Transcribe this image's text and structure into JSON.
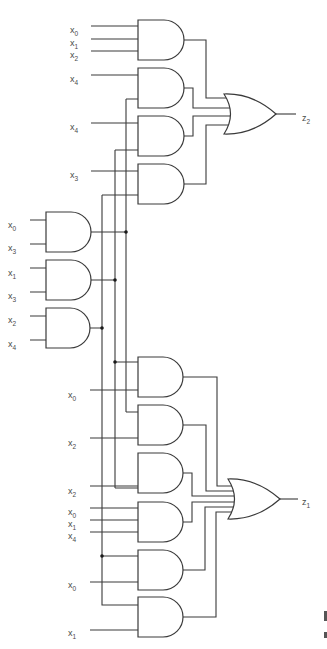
{
  "diagram": {
    "colors": {
      "line": "#3a3a3a",
      "text": "#4a4a4a",
      "background": "#ffffff"
    },
    "buses": [
      {
        "id": "bus_a",
        "x": 102,
        "y1": 195,
        "y2": 597,
        "source": "and_g7"
      },
      {
        "id": "bus_b",
        "x": 115,
        "y1": 150,
        "y2": 488,
        "source": "and_g6"
      },
      {
        "id": "bus_c",
        "x": 126,
        "y1": 103,
        "y2": 412,
        "source": "and_g5"
      }
    ],
    "junctions": [
      {
        "x": 126,
        "y": 232
      },
      {
        "x": 115,
        "y": 280
      },
      {
        "x": 102,
        "y": 328
      },
      {
        "x": 115,
        "y": 362
      },
      {
        "x": 102,
        "y": 556
      }
    ],
    "and_gates": [
      {
        "id": "g1",
        "x": 138,
        "y": 20,
        "w": 46,
        "h": 40
      },
      {
        "id": "g2",
        "x": 138,
        "y": 68,
        "w": 46,
        "h": 40
      },
      {
        "id": "g3",
        "x": 138,
        "y": 116,
        "w": 46,
        "h": 40
      },
      {
        "id": "g4",
        "x": 138,
        "y": 164,
        "w": 46,
        "h": 40
      },
      {
        "id": "g5",
        "x": 46,
        "y": 212,
        "w": 45,
        "h": 40
      },
      {
        "id": "g6",
        "x": 46,
        "y": 260,
        "w": 45,
        "h": 40
      },
      {
        "id": "g7",
        "x": 46,
        "y": 308,
        "w": 44,
        "h": 40
      },
      {
        "id": "g8",
        "x": 138,
        "y": 357,
        "w": 45,
        "h": 40
      },
      {
        "id": "g9",
        "x": 138,
        "y": 405,
        "w": 45,
        "h": 40
      },
      {
        "id": "g10",
        "x": 138,
        "y": 453,
        "w": 45,
        "h": 40
      },
      {
        "id": "g11",
        "x": 138,
        "y": 502,
        "w": 45,
        "h": 40
      },
      {
        "id": "g12",
        "x": 138,
        "y": 550,
        "w": 45,
        "h": 40
      },
      {
        "id": "g13",
        "x": 138,
        "y": 597,
        "w": 45,
        "h": 40
      }
    ],
    "or_gates": [
      {
        "id": "or_z2",
        "x": 224,
        "y": 94,
        "w": 52,
        "h": 40,
        "output": "z2"
      },
      {
        "id": "or_z1",
        "x": 228,
        "y": 479,
        "w": 52,
        "h": 40,
        "output": "z1"
      }
    ],
    "input_labels": [
      {
        "base": "x",
        "sub": "0",
        "x": 80,
        "y": 30
      },
      {
        "base": "x",
        "sub": "1",
        "x": 80,
        "y": 43
      },
      {
        "base": "x",
        "sub": "2",
        "x": 80,
        "y": 55
      },
      {
        "base": "x",
        "sub": "4",
        "x": 80,
        "y": 79
      },
      {
        "base": "x",
        "sub": "4",
        "x": 80,
        "y": 127
      },
      {
        "base": "x",
        "sub": "3",
        "x": 80,
        "y": 175
      },
      {
        "base": "x",
        "sub": "0",
        "x": 18,
        "y": 225
      },
      {
        "base": "x",
        "sub": "3",
        "x": 18,
        "y": 248
      },
      {
        "base": "x",
        "sub": "1",
        "x": 18,
        "y": 273
      },
      {
        "base": "x",
        "sub": "3",
        "x": 18,
        "y": 296
      },
      {
        "base": "x",
        "sub": "2",
        "x": 18,
        "y": 320
      },
      {
        "base": "x",
        "sub": "4",
        "x": 18,
        "y": 344
      },
      {
        "base": "x",
        "sub": "0",
        "x": 78,
        "y": 395
      },
      {
        "base": "x",
        "sub": "2",
        "x": 78,
        "y": 443
      },
      {
        "base": "x",
        "sub": "2",
        "x": 78,
        "y": 491
      },
      {
        "base": "x",
        "sub": "0",
        "x": 78,
        "y": 512
      },
      {
        "base": "x",
        "sub": "1",
        "x": 78,
        "y": 524
      },
      {
        "base": "x",
        "sub": "4",
        "x": 78,
        "y": 536
      },
      {
        "base": "x",
        "sub": "0",
        "x": 78,
        "y": 585
      },
      {
        "base": "x",
        "sub": "1",
        "x": 78,
        "y": 633
      }
    ],
    "output_labels": [
      {
        "base": "z",
        "sub": "2",
        "x": 302,
        "y": 118
      },
      {
        "base": "z",
        "sub": "1",
        "x": 302,
        "y": 502
      }
    ]
  }
}
